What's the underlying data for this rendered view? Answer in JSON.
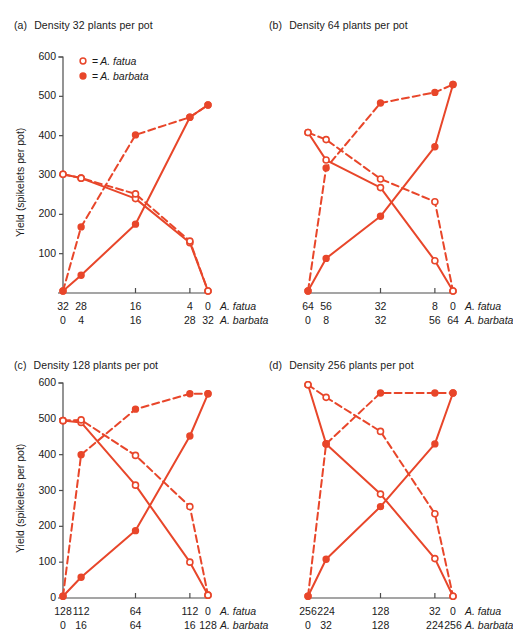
{
  "figure": {
    "ylabel": "Yield (spikelets per pot)",
    "series_color": "#E8462A",
    "axis_color": "#4d4d4d",
    "legend": {
      "fatua": {
        "marker": "open-circle",
        "eq": "=",
        "name": "A. fatua"
      },
      "barbata": {
        "marker": "filled-circle",
        "eq": "=",
        "name": "A. barbata"
      }
    },
    "row_labels": {
      "fatua": "A. fatua",
      "barbata": "A. barbata"
    },
    "yticks": [
      0,
      100,
      200,
      300,
      400,
      500,
      600
    ]
  },
  "panels": [
    {
      "tag": "(a)",
      "title": "Density 32 plants per pot",
      "show_yaxis": true,
      "show_zero_tick": false,
      "x_ticks_fatua": [
        "32",
        "28",
        "16",
        "4",
        "0"
      ],
      "x_ticks_barbata": [
        "0",
        "4",
        "16",
        "28",
        "32"
      ],
      "tick_positions": [
        0,
        0.125,
        0.5,
        0.875,
        1.0
      ],
      "major_ticks": [
        0,
        0.5,
        0.875,
        1.0
      ]
    },
    {
      "tag": "(b)",
      "title": "Density 64 plants per pot",
      "show_yaxis": false,
      "show_zero_tick": false,
      "x_ticks_fatua": [
        "64",
        "56",
        "32",
        "8",
        "0"
      ],
      "x_ticks_barbata": [
        "0",
        "8",
        "32",
        "56",
        "64"
      ],
      "tick_positions": [
        0,
        0.125,
        0.5,
        0.875,
        1.0
      ],
      "major_ticks": [
        0,
        0.5,
        0.875,
        1.0
      ]
    },
    {
      "tag": "(c)",
      "title": "Density 128 plants per pot",
      "show_yaxis": true,
      "show_zero_tick": true,
      "x_ticks_fatua": [
        "128",
        "112",
        "64",
        "112",
        "0"
      ],
      "x_ticks_barbata": [
        "0",
        "16",
        "64",
        "16",
        "128"
      ],
      "tick_positions": [
        0,
        0.125,
        0.5,
        0.875,
        1.0
      ],
      "major_ticks": [
        0,
        0.5,
        0.875,
        1.0
      ]
    },
    {
      "tag": "(d)",
      "title": "Density 256 plants per pot",
      "show_yaxis": false,
      "show_zero_tick": false,
      "x_ticks_fatua": [
        "256",
        "224",
        "128",
        "32",
        "0"
      ],
      "x_ticks_barbata": [
        "0",
        "32",
        "128",
        "224",
        "256"
      ],
      "tick_positions": [
        0,
        0.125,
        0.5,
        0.875,
        1.0
      ],
      "major_ticks": [
        0,
        0.5,
        0.875,
        1.0
      ]
    }
  ],
  "chart_data": [
    {
      "type": "line",
      "panel": "(a)",
      "title": "Density 32 plants per pot",
      "xlabel_rows": [
        "A. fatua",
        "A. barbata"
      ],
      "ylabel": "Yield (spikelets per pot)",
      "ylim": [
        0,
        600
      ],
      "x_fatua": [
        32,
        28,
        16,
        4,
        0
      ],
      "x_barbata": [
        0,
        4,
        16,
        28,
        32
      ],
      "grid": false,
      "legend_position": "top-left",
      "series": [
        {
          "name": "A. fatua (pure/mixture, solid)",
          "marker": "open-circle",
          "line": "solid",
          "values": [
            302,
            292,
            240,
            128,
            5
          ]
        },
        {
          "name": "A. fatua (dashed)",
          "marker": "open-circle",
          "line": "dashed",
          "values": [
            302,
            292,
            252,
            132,
            5
          ]
        },
        {
          "name": "A. barbata (solid)",
          "marker": "filled-circle",
          "line": "solid",
          "values": [
            5,
            45,
            175,
            447,
            478
          ]
        },
        {
          "name": "A. barbata (dashed)",
          "marker": "filled-circle",
          "line": "dashed",
          "values": [
            5,
            168,
            402,
            447,
            478
          ]
        }
      ]
    },
    {
      "type": "line",
      "panel": "(b)",
      "title": "Density 64 plants per pot",
      "xlabel_rows": [
        "A. fatua",
        "A. barbata"
      ],
      "ylabel": "Yield (spikelets per pot)",
      "ylim": [
        0,
        600
      ],
      "x_fatua": [
        64,
        56,
        32,
        8,
        0
      ],
      "x_barbata": [
        0,
        8,
        32,
        56,
        64
      ],
      "grid": false,
      "legend_position": "none",
      "series": [
        {
          "name": "A. fatua (solid)",
          "marker": "open-circle",
          "line": "solid",
          "values": [
            408,
            338,
            268,
            82,
            5
          ]
        },
        {
          "name": "A. fatua (dashed)",
          "marker": "open-circle",
          "line": "dashed",
          "values": [
            408,
            390,
            290,
            232,
            5
          ]
        },
        {
          "name": "A. barbata (solid)",
          "marker": "filled-circle",
          "line": "solid",
          "values": [
            5,
            88,
            195,
            372,
            530
          ]
        },
        {
          "name": "A. barbata (dashed)",
          "marker": "filled-circle",
          "line": "dashed",
          "values": [
            5,
            318,
            483,
            510,
            530
          ]
        }
      ]
    },
    {
      "type": "line",
      "panel": "(c)",
      "title": "Density 128 plants per pot",
      "xlabel_rows": [
        "A. fatua",
        "A. barbata"
      ],
      "ylabel": "Yield (spikelets per pot)",
      "ylim": [
        0,
        600
      ],
      "x_fatua": [
        128,
        112,
        64,
        112,
        0
      ],
      "x_barbata": [
        0,
        16,
        64,
        16,
        128
      ],
      "grid": false,
      "legend_position": "none",
      "series": [
        {
          "name": "A. fatua (solid)",
          "marker": "open-circle",
          "line": "solid",
          "values": [
            495,
            490,
            315,
            100,
            8
          ]
        },
        {
          "name": "A. fatua (dashed)",
          "marker": "open-circle",
          "line": "dashed",
          "values": [
            495,
            497,
            398,
            255,
            8
          ]
        },
        {
          "name": "A. barbata (solid)",
          "marker": "filled-circle",
          "line": "solid",
          "values": [
            5,
            58,
            188,
            452,
            570
          ]
        },
        {
          "name": "A. barbata (dashed)",
          "marker": "filled-circle",
          "line": "dashed",
          "values": [
            5,
            400,
            527,
            570,
            570
          ]
        }
      ]
    },
    {
      "type": "line",
      "panel": "(d)",
      "title": "Density 256 plants per pot",
      "xlabel_rows": [
        "A. fatua",
        "A. barbata"
      ],
      "ylabel": "Yield (spikelets per pot)",
      "ylim": [
        0,
        600
      ],
      "x_fatua": [
        256,
        224,
        128,
        32,
        0
      ],
      "x_barbata": [
        0,
        32,
        128,
        224,
        256
      ],
      "grid": false,
      "legend_position": "none",
      "series": [
        {
          "name": "A. fatua (solid)",
          "marker": "open-circle",
          "line": "solid",
          "values": [
            595,
            430,
            290,
            110,
            5
          ]
        },
        {
          "name": "A. fatua (dashed)",
          "marker": "open-circle",
          "line": "dashed",
          "values": [
            595,
            560,
            465,
            235,
            5
          ]
        },
        {
          "name": "A. barbata (solid)",
          "marker": "filled-circle",
          "line": "solid",
          "values": [
            5,
            108,
            255,
            430,
            572
          ]
        },
        {
          "name": "A. barbata (dashed)",
          "marker": "filled-circle",
          "line": "dashed",
          "values": [
            5,
            430,
            572,
            572,
            572
          ]
        }
      ]
    }
  ]
}
